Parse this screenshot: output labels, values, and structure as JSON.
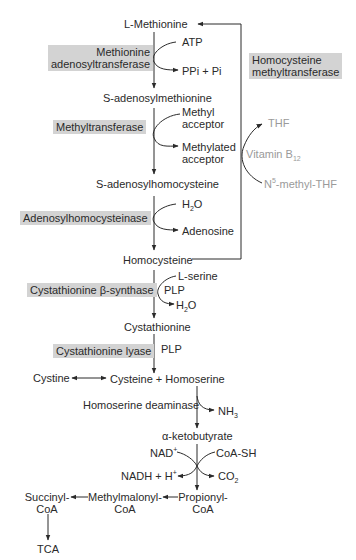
{
  "colors": {
    "text": "#2a2a2a",
    "enzyme_box": "#d3d3d3",
    "cofactor_gray": "#9a9a9a",
    "line": "#2a2a2a"
  },
  "metabolites": {
    "l_methionine": "L-Methionine",
    "sam": "S-adenosylmethionine",
    "sah": "S-adenosylhomocysteine",
    "homocysteine": "Homocysteine",
    "cystathionine": "Cystathionine",
    "cystine": "Cystine",
    "cysteine_homoserine": "Cysteine + Homoserine",
    "alpha_ketobutyrate": "α-ketobutyrate",
    "propionyl_coa_1": "Propionyl-",
    "propionyl_coa_2": "CoA",
    "methylmalonyl_coa_1": "Methylmalonyl-",
    "methylmalonyl_coa_2": "CoA",
    "succinyl_coa_1": "Succinyl-",
    "succinyl_coa_2": "CoA",
    "tca": "TCA"
  },
  "enzymes": {
    "mat_1": "Methionine",
    "mat_2": "adenosyltransferase",
    "methyltransferase": "Methyltransferase",
    "adenosylhomocysteinase": "Adenosylhomocysteinase",
    "cbs": "Cystathionine β-synthase",
    "cystathionine_lyase": "Cystathionine lyase",
    "homoserine_deaminase": "Homoserine deaminase",
    "hmt_1": "Homocysteine",
    "hmt_2": "methyltransferase"
  },
  "cofactors": {
    "atp": "ATP",
    "ppi_pi": "PPi + Pi",
    "methyl_acceptor_1": "Methyl",
    "methyl_acceptor_2": "acceptor",
    "methylated_acceptor_1": "Methylated",
    "methylated_acceptor_2": "acceptor",
    "h2o_1_a": "H",
    "h2o_1_sub": "2",
    "h2o_1_b": "O",
    "adenosine": "Adenosine",
    "l_serine": "L-serine",
    "plp_1": "PLP",
    "h2o_2_a": "H",
    "h2o_2_sub": "2",
    "h2o_2_b": "O",
    "plp_2": "PLP",
    "nh3_a": "NH",
    "nh3_sub": "3",
    "nad_a": "NAD",
    "nad_sup": "+",
    "coa_sh": "CoA-SH",
    "nadh_a": "NADH + H",
    "nadh_sup": "+",
    "co2_a": "CO",
    "co2_sub": "2",
    "thf": "THF",
    "vitb12_a": "Vitamin B",
    "vitb12_sub": "12",
    "n5_a": "N",
    "n5_sup": "5",
    "n5_b": "-methyl-THF"
  }
}
